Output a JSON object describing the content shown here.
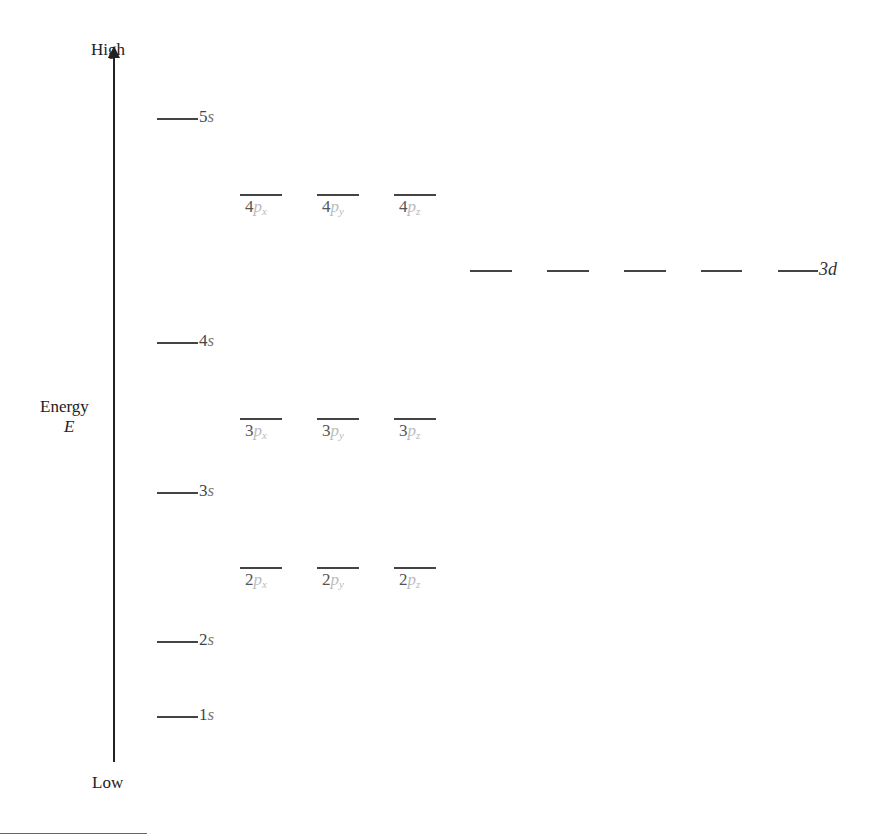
{
  "diagram": {
    "axis": {
      "top_label": "High",
      "bottom_label": "Low",
      "name": "Energy",
      "symbol": "E"
    },
    "s_levels": [
      {
        "n": "5",
        "sym": "s",
        "y": 118
      },
      {
        "n": "4",
        "sym": "s",
        "y": 342
      },
      {
        "n": "3",
        "sym": "s",
        "y": 492
      },
      {
        "n": "2",
        "sym": "s",
        "y": 641
      },
      {
        "n": "1",
        "sym": "s",
        "y": 716
      }
    ],
    "p_levels": [
      {
        "n": "4",
        "y": 194,
        "orbitals": [
          {
            "sym": "p",
            "sub": "x"
          },
          {
            "sym": "p",
            "sub": "y"
          },
          {
            "sym": "p",
            "sub": "z"
          }
        ]
      },
      {
        "n": "3",
        "y": 418,
        "orbitals": [
          {
            "sym": "p",
            "sub": "x"
          },
          {
            "sym": "p",
            "sub": "y"
          },
          {
            "sym": "p",
            "sub": "z"
          }
        ]
      },
      {
        "n": "2",
        "y": 567,
        "orbitals": [
          {
            "sym": "p",
            "sub": "x"
          },
          {
            "sym": "p",
            "sub": "y"
          },
          {
            "sym": "p",
            "sub": "z"
          }
        ]
      }
    ],
    "d_level": {
      "label": "3d",
      "y": 270,
      "count": 5
    }
  }
}
